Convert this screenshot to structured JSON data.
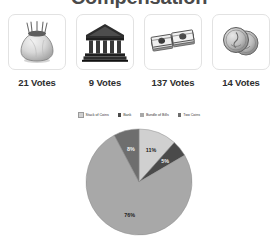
{
  "page": {
    "title": "Compensation"
  },
  "options": [
    {
      "id": "stack-of-coins",
      "icon": "money-bag-icon",
      "name": "Stack of Coins",
      "votes_label": "21 Votes",
      "votes": 21
    },
    {
      "id": "bank",
      "icon": "bank-building-icon",
      "name": "Bank",
      "votes_label": "9 Votes",
      "votes": 9
    },
    {
      "id": "bundle-of-bills",
      "icon": "bundle-of-bills-icon",
      "name": "Bundle of Bills",
      "votes_label": "137 Votes",
      "votes": 137
    },
    {
      "id": "two-coins",
      "icon": "two-coins-icon",
      "name": "Two Coins",
      "votes_label": "14 Votes",
      "votes": 14
    }
  ],
  "legend": {
    "position": "top",
    "items": [
      {
        "label": "Stack of Coins",
        "color": "#d0d0d0"
      },
      {
        "label": "Bank",
        "color": "#4a4a4a"
      },
      {
        "label": "Bundle of Bills",
        "color": "#a8a8a8"
      },
      {
        "label": "Two Coins",
        "color": "#6e6e6e"
      }
    ]
  },
  "chart_data": {
    "type": "pie",
    "title": "Compensation",
    "categories": [
      "Stack of Coins",
      "Bank",
      "Bundle of Bills",
      "Two Coins"
    ],
    "values": [
      21,
      9,
      137,
      14
    ],
    "percent_labels": [
      "11%",
      "5%",
      "76%",
      "8%"
    ],
    "percents": [
      11,
      5,
      76,
      8
    ],
    "colors": [
      "#d0d0d0",
      "#4a4a4a",
      "#a8a8a8",
      "#6e6e6e"
    ],
    "label_colors": [
      "#1d1d1d",
      "#f2f2f2",
      "#1d1d1d",
      "#f2f2f2"
    ],
    "total_votes": 181,
    "legend_position": "top",
    "grid": false
  }
}
